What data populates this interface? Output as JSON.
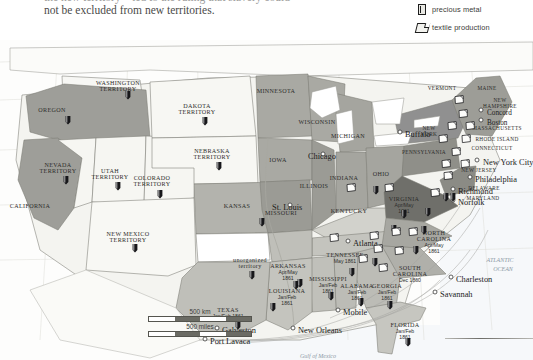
{
  "intro": {
    "line1": "the new territory—led to the ruling that slavery could",
    "line2": "not be excluded from new territories."
  },
  "legend": {
    "items": [
      {
        "icon": "precious-metal-icon",
        "label": "precious metal"
      },
      {
        "icon": "textile-production-icon",
        "label": "textile production"
      },
      {
        "icon": "manufacturing-city-icon",
        "label": "manufacturing city"
      }
    ]
  },
  "scale": {
    "km": "500 km",
    "miles": "500 miles"
  },
  "map": {
    "states": [
      {
        "name": "WASHINGTON\nTERRITORY",
        "x": 118,
        "y": 45,
        "size": "st"
      },
      {
        "name": "OREGON",
        "x": 52,
        "y": 72,
        "size": "st"
      },
      {
        "name": "NEVADA\nTERRITORY",
        "x": 58,
        "y": 127,
        "size": "st"
      },
      {
        "name": "UTAH\nTERRITORY",
        "x": 110,
        "y": 133,
        "size": "st"
      },
      {
        "name": "CALIFORNIA",
        "x": 30,
        "y": 168,
        "size": "st"
      },
      {
        "name": "COLORADO\nTERRITORY",
        "x": 152,
        "y": 140,
        "size": "st"
      },
      {
        "name": "NEW MEXICO\nTERRITORY",
        "x": 128,
        "y": 196,
        "size": "st"
      },
      {
        "name": "DAKOTA\nTERRITORY",
        "x": 197,
        "y": 68,
        "size": "st"
      },
      {
        "name": "NEBRASKA\nTERRITORY",
        "x": 212,
        "y": 113,
        "size": "st"
      },
      {
        "name": "KANSAS",
        "x": 237,
        "y": 168,
        "size": "st"
      },
      {
        "name": "MINNESOTA",
        "x": 276,
        "y": 53,
        "size": "st"
      },
      {
        "name": "WISCONSIN",
        "x": 317,
        "y": 84,
        "size": "st"
      },
      {
        "name": "IOWA",
        "x": 278,
        "y": 122,
        "size": "st"
      },
      {
        "name": "MICHIGAN",
        "x": 348,
        "y": 98,
        "size": "st"
      },
      {
        "name": "ILLINOIS",
        "x": 314,
        "y": 148,
        "size": "st"
      },
      {
        "name": "MISSOURI",
        "x": 281,
        "y": 175,
        "size": "st"
      },
      {
        "name": "INDIANA",
        "x": 344,
        "y": 140,
        "size": "st"
      },
      {
        "name": "OHIO",
        "x": 381,
        "y": 136,
        "size": "st"
      },
      {
        "name": "KENTUCKY",
        "x": 349,
        "y": 173,
        "size": "st"
      },
      {
        "name": "PENNSYLVANIA",
        "x": 424,
        "y": 114,
        "size": "st-sm"
      },
      {
        "name": "NEW\nYORK",
        "x": 429,
        "y": 90,
        "size": "st-sm"
      },
      {
        "name": "VERMONT",
        "x": 442,
        "y": 50,
        "size": "st-sm"
      },
      {
        "name": "MAINE",
        "x": 487,
        "y": 50,
        "size": "st-sm"
      },
      {
        "name": "NEW\nHAMPSHIRE",
        "x": 500,
        "y": 62,
        "size": "st-sm"
      },
      {
        "name": "MASSACHUSETTS",
        "x": 497,
        "y": 90,
        "size": "st-sm"
      },
      {
        "name": "RHODE ISLAND",
        "x": 497,
        "y": 101,
        "size": "st-sm"
      },
      {
        "name": "CONNECTICUT",
        "x": 492,
        "y": 110,
        "size": "st-sm"
      },
      {
        "name": "NEW JERSEY",
        "x": 479,
        "y": 132,
        "size": "st-sm"
      },
      {
        "name": "DELAWARE",
        "x": 484,
        "y": 150,
        "size": "st-sm"
      },
      {
        "name": "MARYLAND",
        "x": 483,
        "y": 160,
        "size": "st-sm"
      }
    ],
    "seceded": [
      {
        "name": "VIRGINIA",
        "date": "Apr/May\n1861",
        "x": 404,
        "y": 161
      },
      {
        "name": "NORTH\nCAROLINA",
        "date": "Apr/May\n1861",
        "x": 434,
        "y": 195
      },
      {
        "name": "SOUTH\nCAROLINA",
        "date": "Dec 1860",
        "x": 410,
        "y": 230
      },
      {
        "name": "GEORGIA",
        "date": "Jan/Feb\n1861",
        "x": 387,
        "y": 248
      },
      {
        "name": "FLORIDA",
        "date": "Jan/Feb\n1861",
        "x": 405,
        "y": 287
      },
      {
        "name": "ALABAMA",
        "date": "Jan/Feb\n1861",
        "x": 357,
        "y": 248
      },
      {
        "name": "MISSISSIPPI",
        "date": "Jan/Feb\n1861",
        "x": 328,
        "y": 241
      },
      {
        "name": "LOUISIANA",
        "date": "Jan/Feb\n1861",
        "x": 287,
        "y": 253
      },
      {
        "name": "TEXAS",
        "date": "Jan/Feb 1861",
        "x": 228,
        "y": 272
      },
      {
        "name": "ARKANSAS",
        "date": "Apr/May\n1861",
        "x": 288,
        "y": 228
      },
      {
        "name": "TENNESSEE",
        "date": "May 1861",
        "x": 345,
        "y": 217
      }
    ],
    "unorganized": {
      "name": "unorganized\nterritory",
      "x": 250,
      "y": 222
    },
    "cities": [
      {
        "name": "Chicago",
        "x": 308,
        "y": 116,
        "big": true
      },
      {
        "name": "St. Louis",
        "x": 272,
        "y": 167,
        "big": true
      },
      {
        "name": "Buffalo",
        "x": 405,
        "y": 94,
        "big": true
      },
      {
        "name": "Concord",
        "x": 487,
        "y": 72,
        "big": false
      },
      {
        "name": "Boston",
        "x": 487,
        "y": 82,
        "big": false
      },
      {
        "name": "New York City",
        "x": 483,
        "y": 122,
        "big": true
      },
      {
        "name": "Philadelphia",
        "x": 475,
        "y": 139,
        "big": true
      },
      {
        "name": "Richmond",
        "x": 458,
        "y": 151,
        "big": true
      },
      {
        "name": "Norfolk",
        "x": 458,
        "y": 162,
        "big": true
      },
      {
        "name": "Atlanta",
        "x": 353,
        "y": 203,
        "big": true
      },
      {
        "name": "Charleston",
        "x": 456,
        "y": 239,
        "big": true
      },
      {
        "name": "Savannah",
        "x": 440,
        "y": 254,
        "big": true
      },
      {
        "name": "Mobile",
        "x": 343,
        "y": 272,
        "big": true
      },
      {
        "name": "New Orleans",
        "x": 298,
        "y": 290,
        "big": true
      },
      {
        "name": "Galveston",
        "x": 222,
        "y": 290,
        "big": true
      },
      {
        "name": "Port Lavaca",
        "x": 210,
        "y": 301,
        "big": true
      }
    ],
    "metal_markers": [
      {
        "x": 128,
        "y": 55
      },
      {
        "x": 68,
        "y": 80
      },
      {
        "x": 66,
        "y": 140
      },
      {
        "x": 118,
        "y": 146
      },
      {
        "x": 160,
        "y": 154
      },
      {
        "x": 135,
        "y": 208
      },
      {
        "x": 205,
        "y": 81
      },
      {
        "x": 219,
        "y": 126
      },
      {
        "x": 262,
        "y": 182
      },
      {
        "x": 252,
        "y": 235
      },
      {
        "x": 296,
        "y": 245
      },
      {
        "x": 238,
        "y": 285
      },
      {
        "x": 273,
        "y": 267
      },
      {
        "x": 331,
        "y": 256
      },
      {
        "x": 361,
        "y": 262
      },
      {
        "x": 390,
        "y": 265
      },
      {
        "x": 408,
        "y": 302
      },
      {
        "x": 300,
        "y": 243
      },
      {
        "x": 352,
        "y": 232
      },
      {
        "x": 375,
        "y": 222
      },
      {
        "x": 416,
        "y": 210
      },
      {
        "x": 428,
        "y": 172
      },
      {
        "x": 404,
        "y": 174
      },
      {
        "x": 394,
        "y": 189
      },
      {
        "x": 424,
        "y": 190
      },
      {
        "x": 446,
        "y": 157
      },
      {
        "x": 453,
        "y": 157
      },
      {
        "x": 376,
        "y": 150
      }
    ],
    "textile_markers": [
      {
        "x": 459,
        "y": 60
      },
      {
        "x": 463,
        "y": 74
      },
      {
        "x": 452,
        "y": 86
      },
      {
        "x": 470,
        "y": 86
      },
      {
        "x": 443,
        "y": 99
      },
      {
        "x": 466,
        "y": 99
      },
      {
        "x": 456,
        "y": 112
      },
      {
        "x": 446,
        "y": 124
      },
      {
        "x": 465,
        "y": 124
      },
      {
        "x": 448,
        "y": 136
      },
      {
        "x": 435,
        "y": 153
      },
      {
        "x": 389,
        "y": 148
      },
      {
        "x": 351,
        "y": 148
      },
      {
        "x": 374,
        "y": 196
      },
      {
        "x": 396,
        "y": 192
      },
      {
        "x": 413,
        "y": 192
      },
      {
        "x": 378,
        "y": 209
      },
      {
        "x": 399,
        "y": 211
      },
      {
        "x": 363,
        "y": 219
      },
      {
        "x": 383,
        "y": 228
      },
      {
        "x": 334,
        "y": 198
      }
    ],
    "city_dots": [
      {
        "x": 323,
        "y": 114
      },
      {
        "x": 290,
        "y": 165
      },
      {
        "x": 400,
        "y": 92
      },
      {
        "x": 481,
        "y": 70
      },
      {
        "x": 481,
        "y": 80
      },
      {
        "x": 477,
        "y": 120
      },
      {
        "x": 470,
        "y": 137
      },
      {
        "x": 453,
        "y": 149
      },
      {
        "x": 453,
        "y": 160
      },
      {
        "x": 348,
        "y": 201
      },
      {
        "x": 451,
        "y": 237
      },
      {
        "x": 435,
        "y": 252
      },
      {
        "x": 338,
        "y": 270
      },
      {
        "x": 293,
        "y": 288
      },
      {
        "x": 217,
        "y": 288
      },
      {
        "x": 205,
        "y": 299
      }
    ],
    "ocean_labels": [
      {
        "name": "ATLANTIC",
        "x": 500,
        "y": 222
      },
      {
        "name": "OCEAN",
        "x": 503,
        "y": 231
      },
      {
        "name": "Gulf of Mexico",
        "x": 318,
        "y": 318
      }
    ]
  },
  "colors": {
    "union_dark": "#9e9e99",
    "union_mid": "#b9b9b3",
    "confederate": "#c9c9c3",
    "border_states": "#d8d8d2",
    "territory": "#f4f4f0",
    "water": "#f7f8f9",
    "outline": "#6f6f6a"
  }
}
